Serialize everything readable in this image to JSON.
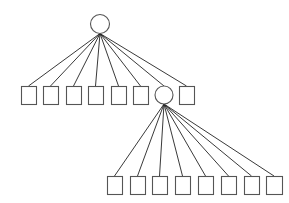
{
  "diagram": {
    "type": "tree",
    "width": 289,
    "height": 203,
    "colors": {
      "stroke": "#555555",
      "edge": "#222222",
      "fill": "#ffffff",
      "background": "#ffffff"
    },
    "nodes": [
      {
        "id": "root",
        "shape": "circle",
        "cx": 100,
        "cy": 24,
        "r": 9.5
      },
      {
        "id": "a1",
        "shape": "square",
        "x": 21,
        "y": 86,
        "w": 15,
        "h": 18
      },
      {
        "id": "a2",
        "shape": "square",
        "x": 43,
        "y": 86,
        "w": 15,
        "h": 18
      },
      {
        "id": "a3",
        "shape": "square",
        "x": 66,
        "y": 86,
        "w": 15,
        "h": 18
      },
      {
        "id": "a4",
        "shape": "square",
        "x": 88,
        "y": 86,
        "w": 15,
        "h": 18
      },
      {
        "id": "a5",
        "shape": "square",
        "x": 111,
        "y": 86,
        "w": 15,
        "h": 18
      },
      {
        "id": "a6",
        "shape": "square",
        "x": 133,
        "y": 86,
        "w": 15,
        "h": 18
      },
      {
        "id": "hub2",
        "shape": "circle",
        "cx": 164,
        "cy": 95,
        "r": 9
      },
      {
        "id": "a8",
        "shape": "square",
        "x": 179,
        "y": 86,
        "w": 15,
        "h": 18
      },
      {
        "id": "b1",
        "shape": "square",
        "x": 107,
        "y": 176,
        "w": 15,
        "h": 18
      },
      {
        "id": "b2",
        "shape": "square",
        "x": 130,
        "y": 176,
        "w": 15,
        "h": 18
      },
      {
        "id": "b3",
        "shape": "square",
        "x": 152,
        "y": 176,
        "w": 15,
        "h": 18
      },
      {
        "id": "b4",
        "shape": "square",
        "x": 175,
        "y": 176,
        "w": 15,
        "h": 18
      },
      {
        "id": "b5",
        "shape": "square",
        "x": 198,
        "y": 176,
        "w": 15,
        "h": 18
      },
      {
        "id": "b6",
        "shape": "square",
        "x": 221,
        "y": 176,
        "w": 15,
        "h": 18
      },
      {
        "id": "b7",
        "shape": "square",
        "x": 244,
        "y": 176,
        "w": 15,
        "h": 18
      },
      {
        "id": "b8",
        "shape": "square",
        "x": 266,
        "y": 176,
        "w": 16,
        "h": 18
      }
    ],
    "edges": [
      {
        "from": "root",
        "to": "a1"
      },
      {
        "from": "root",
        "to": "a2"
      },
      {
        "from": "root",
        "to": "a3"
      },
      {
        "from": "root",
        "to": "a4"
      },
      {
        "from": "root",
        "to": "a5"
      },
      {
        "from": "root",
        "to": "a6"
      },
      {
        "from": "root",
        "to": "hub2"
      },
      {
        "from": "root",
        "to": "a8"
      },
      {
        "from": "hub2",
        "to": "b1"
      },
      {
        "from": "hub2",
        "to": "b2"
      },
      {
        "from": "hub2",
        "to": "b3"
      },
      {
        "from": "hub2",
        "to": "b4"
      },
      {
        "from": "hub2",
        "to": "b5"
      },
      {
        "from": "hub2",
        "to": "b6"
      },
      {
        "from": "hub2",
        "to": "b7"
      },
      {
        "from": "hub2",
        "to": "b8"
      }
    ]
  }
}
